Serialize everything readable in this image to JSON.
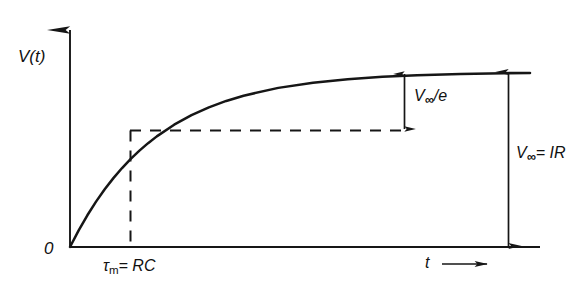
{
  "figure": {
    "background_color": "#ffffff",
    "ink_color": "#1a1a1a",
    "y_axis_label": "V(t)",
    "x_axis_label": "t",
    "x_axis_arrow": "⟶",
    "origin_label": "0",
    "tau_symbol": "τ",
    "tau_subscript": "m",
    "tau_equation_rest": "= RC",
    "v_symbol": "V",
    "v_subscript": "∞",
    "vinf_over_e_rest": "/e",
    "vinf_ir_rest": "= IR",
    "tau_label_full": "τm = RC",
    "vinf_e_label_full": "V∞/e",
    "vinf_ir_label_full": "V∞ = IR"
  },
  "chart_data": {
    "type": "line",
    "title": "",
    "subtitle": "",
    "xlabel": "t",
    "ylabel": "V(t)",
    "xlim": [
      0,
      5.3
    ],
    "ylim": [
      0,
      1.18
    ],
    "grid": false,
    "legend_position": "none",
    "curve_equation": "V(t) = V_inf * (1 - exp(-t / tau_m))",
    "series": [
      {
        "name": "V(t)",
        "x": [
          0,
          0.1,
          0.2,
          0.3,
          0.4,
          0.5,
          0.6,
          0.7,
          0.8,
          0.9,
          1.0,
          1.2,
          1.4,
          1.6,
          1.8,
          2.0,
          2.4,
          2.8,
          3.2,
          3.6,
          4.0,
          4.5,
          5.0,
          5.3
        ],
        "y": [
          0,
          0.0952,
          0.1813,
          0.2592,
          0.3297,
          0.3935,
          0.4512,
          0.5034,
          0.5507,
          0.5934,
          0.6321,
          0.6988,
          0.7534,
          0.7981,
          0.8347,
          0.8647,
          0.9093,
          0.9392,
          0.9592,
          0.9727,
          0.9817,
          0.9889,
          0.9933,
          0.995
        ]
      }
    ],
    "annotations": [
      {
        "name": "tau-marker",
        "text": "τm = RC",
        "x": 1.0,
        "y": 0.6321,
        "kind": "dashed-guide-lines"
      },
      {
        "name": "vinf-over-e-arrow",
        "text": "V∞/e",
        "value": 0.3679,
        "from_y": 0.6321,
        "to_y": 1.0,
        "at_x": 3.55,
        "kind": "double-arrow"
      },
      {
        "name": "vinf-equals-ir-arrow",
        "text": "V∞ = IR",
        "value": 1.0,
        "from_y": 0.0,
        "to_y": 1.0,
        "at_x": 4.65,
        "kind": "double-arrow"
      }
    ],
    "asymptote": {
      "name": "v-infinity-asymptote",
      "y": 1.0,
      "label": "V∞"
    }
  }
}
